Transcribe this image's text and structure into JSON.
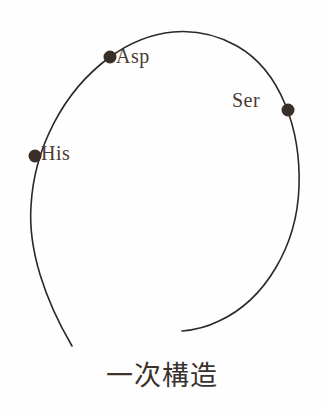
{
  "figure": {
    "caption": "一次構造",
    "background_color": "#fefefe",
    "stroke_color": "#2e2823",
    "marker_color": "#3a2e28",
    "label_color": "#473b33",
    "caption_color": "#39322d"
  },
  "chart_data": {
    "type": "diagram",
    "title": "一次構造",
    "curve": {
      "stroke_width": 1.6,
      "closed": false,
      "path": "M 72 346 C 45 300 28 250 31 206 C 34 150 62 92 110 57 C 150 28 196 23 237 46 C 281 71 301 130 299 187 C 297 246 265 300 219 321 C 207 327 194 330 182 331"
    },
    "markers": [
      {
        "id": "asp",
        "label": "Asp",
        "x": 110,
        "y": 57,
        "radius": 6.5,
        "label_x": 116,
        "label_y": 46
      },
      {
        "id": "ser",
        "label": "Ser",
        "x": 288,
        "y": 110,
        "radius": 6.5,
        "label_x": 232,
        "label_y": 90
      },
      {
        "id": "his",
        "label": "His",
        "x": 35,
        "y": 156,
        "radius": 6.5,
        "label_x": 41,
        "label_y": 143
      }
    ],
    "labels": [
      "Asp",
      "Ser",
      "His"
    ]
  }
}
